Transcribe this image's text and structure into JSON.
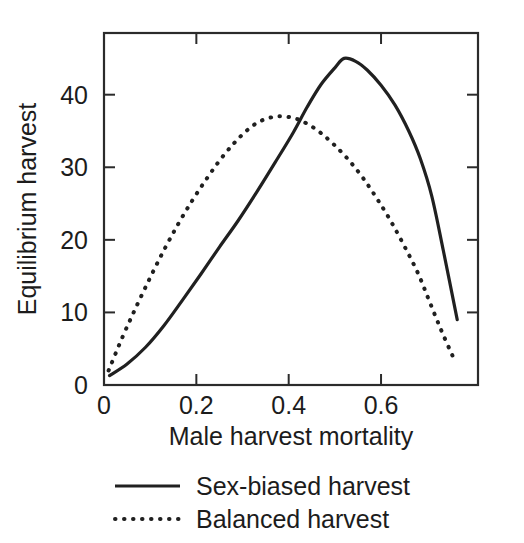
{
  "chart_data": {
    "type": "line",
    "title": "",
    "xlabel": "Male harvest mortality",
    "ylabel": "Equilibrium harvest",
    "xlim": [
      0,
      0.81
    ],
    "ylim": [
      0,
      48.5
    ],
    "xticks": [
      0,
      0.2,
      0.4,
      0.6
    ],
    "xticklabels": [
      "0",
      "0.2",
      "0.4",
      "0.6"
    ],
    "yticks": [
      0,
      10,
      20,
      30,
      40
    ],
    "yticklabels": [
      "0",
      "10",
      "20",
      "30",
      "40"
    ],
    "grid": false,
    "legend_position": "below-axes",
    "frame": "box",
    "series": [
      {
        "name": "Sex-biased harvest",
        "style": "solid",
        "color": "#202020",
        "x": [
          0.012,
          0.05,
          0.09,
          0.13,
          0.17,
          0.21,
          0.25,
          0.29,
          0.33,
          0.37,
          0.41,
          0.44,
          0.47,
          0.5,
          0.52,
          0.545,
          0.57,
          0.6,
          0.63,
          0.66,
          0.685,
          0.71,
          0.735,
          0.765
        ],
        "y": [
          1.3,
          2.9,
          5.2,
          8.2,
          11.7,
          15.3,
          19.0,
          22.6,
          26.5,
          30.6,
          34.8,
          38.3,
          41.4,
          43.7,
          45.0,
          44.6,
          43.4,
          41.3,
          38.6,
          35.0,
          31.2,
          26.0,
          18.5,
          9.0
        ]
      },
      {
        "name": "Balanced harvest",
        "style": "dotted",
        "color": "#202020",
        "x": [
          0.01,
          0.04,
          0.07,
          0.1,
          0.13,
          0.16,
          0.19,
          0.22,
          0.25,
          0.28,
          0.31,
          0.34,
          0.375,
          0.41,
          0.44,
          0.47,
          0.5,
          0.53,
          0.56,
          0.59,
          0.62,
          0.65,
          0.68,
          0.705,
          0.73,
          0.755
        ],
        "y": [
          2.0,
          6.6,
          10.8,
          14.8,
          18.6,
          22.1,
          25.3,
          28.2,
          30.9,
          33.2,
          35.1,
          36.4,
          37.0,
          36.8,
          36.0,
          34.7,
          33.0,
          31.0,
          28.6,
          25.8,
          22.7,
          19.2,
          15.4,
          11.5,
          7.6,
          4.0
        ]
      }
    ],
    "legend": [
      {
        "label": "Sex-biased harvest",
        "style": "solid"
      },
      {
        "label": "Balanced harvest",
        "style": "dotted"
      }
    ]
  }
}
